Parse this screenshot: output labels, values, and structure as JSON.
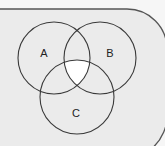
{
  "diagram": {
    "type": "venn",
    "colors": {
      "page_background": "#f6f6f6",
      "panel_fill": "#ebebeb",
      "panel_stroke": "#555555",
      "circle_stroke": "#3a3a3a",
      "highlight_fill": "#ffffff"
    },
    "sets": [
      {
        "id": "A",
        "label": "A",
        "cx": 54,
        "cy": 58,
        "r": 36,
        "label_x": 44,
        "label_y": 57
      },
      {
        "id": "B",
        "label": "B",
        "cx": 100,
        "cy": 58,
        "r": 36,
        "label_x": 110,
        "label_y": 57
      },
      {
        "id": "C",
        "label": "C",
        "cx": 77,
        "cy": 97,
        "r": 37,
        "label_x": 76,
        "label_y": 117
      }
    ],
    "highlighted_region": "A ∩ B ∩ C"
  }
}
